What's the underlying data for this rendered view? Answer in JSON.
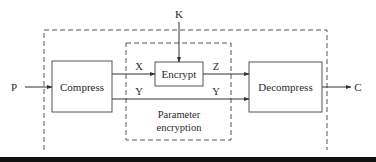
{
  "diagram": {
    "inputs": {
      "plaintext": "P",
      "key": "K"
    },
    "output": {
      "ciphertext": "C"
    },
    "blocks": {
      "compress": "Compress",
      "encrypt": "Encrypt",
      "decompress": "Decompress"
    },
    "signals": {
      "x": "X",
      "y_top": "Y",
      "z": "Z",
      "y_right": "Y"
    },
    "group_label": {
      "line1": "Parameter",
      "line2": "encryption"
    }
  }
}
